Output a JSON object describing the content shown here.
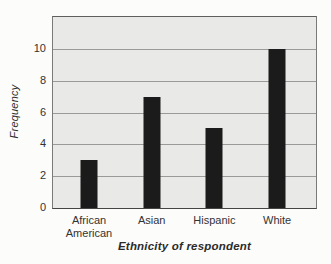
{
  "chart_data": {
    "type": "bar",
    "title": "",
    "categories": [
      "African American",
      "Asian",
      "Hispanic",
      "White"
    ],
    "values": [
      3,
      7,
      5,
      10
    ],
    "xlabel": "Ethnicity of respondent",
    "ylabel": "Frequency",
    "ylim": [
      0,
      12
    ],
    "yticks": [
      0,
      2,
      4,
      6,
      8,
      10
    ],
    "grid": "horizontal-gridlines",
    "legend": "none",
    "colors": {
      "bar": "#1b1b1b",
      "plot_background": "#e9e9e7",
      "gridline": "#9a9a9a",
      "frame": "#7a7a7a",
      "tick_text": "#333333",
      "page_background": "#fcfcfa"
    }
  }
}
